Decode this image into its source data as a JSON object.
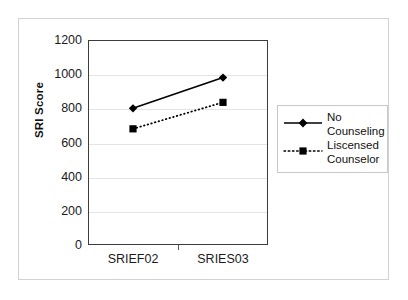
{
  "chart_data": {
    "type": "line",
    "title": "",
    "xlabel": "",
    "ylabel": "SRI Score",
    "categories": [
      "SRIEF02",
      "SRIES03"
    ],
    "ylim": [
      0,
      1200
    ],
    "yticks": [
      0,
      200,
      400,
      600,
      800,
      1000,
      1200
    ],
    "ytick_labels": [
      "0",
      "200",
      "400",
      "600",
      "800",
      "1000",
      "1200"
    ],
    "grid": true,
    "legend_position": "right",
    "series": [
      {
        "name": "No Counseling",
        "values": [
          800,
          980
        ],
        "line_style": "solid",
        "marker": "diamond",
        "color": "#000000"
      },
      {
        "name": "Liscensed Counselor",
        "values": [
          680,
          835
        ],
        "line_style": "dotted",
        "marker": "square",
        "color": "#000000"
      }
    ]
  },
  "legend": {
    "entries": [
      {
        "label_line1": "No",
        "label_line2": "Counseling"
      },
      {
        "label_line1": "Liscensed",
        "label_line2": "Counselor"
      }
    ]
  },
  "colors": {
    "series": "#000000",
    "gridline": "#e4e4e4",
    "axis": "#3c3c3c",
    "frame": "#d2d2d2",
    "text": "#1a1a1a",
    "background": "#ffffff"
  }
}
